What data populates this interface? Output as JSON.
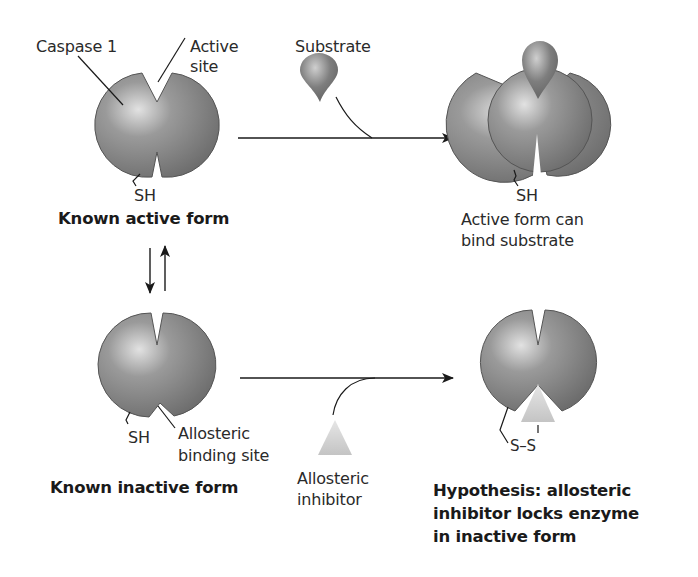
{
  "diagram": {
    "labels": {
      "caspase": "Caspase 1",
      "active_site_1": "Active",
      "active_site_2": "site",
      "substrate": "Substrate",
      "sh_top_left": "SH",
      "known_active": "Known active form",
      "sh_top_right": "SH",
      "active_can_1": "Active form can",
      "active_can_2": "bind substrate",
      "sh_bottom_left": "SH",
      "allosteric_site_1": "Allosteric",
      "allosteric_site_2": "binding site",
      "known_inactive": "Known inactive form",
      "inhibitor_1": "Allosteric",
      "inhibitor_2": "inhibitor",
      "ss": "S–S",
      "hypothesis_1": "Hypothesis: allosteric",
      "hypothesis_2": "inhibitor locks enzyme",
      "hypothesis_3": "in inactive form"
    },
    "colors": {
      "enzyme": "#7d7d7d",
      "enzyme_highlight": "#d8d8d8",
      "substrate": "#6f6f6f",
      "inhibitor": "#cfcfcf",
      "line": "#1a1a1a"
    }
  }
}
